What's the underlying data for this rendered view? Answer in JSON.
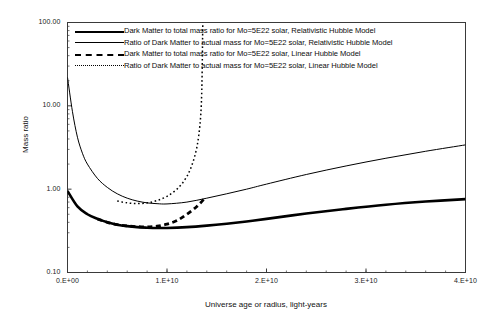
{
  "chart_data": {
    "type": "line",
    "title": "",
    "xlabel": "Universe age or radius, light-years",
    "ylabel": "Mass ratio",
    "yscale": "log",
    "xscale": "linear",
    "xlim": [
      0,
      40000000000
    ],
    "ylim": [
      0.1,
      100
    ],
    "grid": false,
    "legend_position": "top-inside",
    "xticks": [
      "0.E+00",
      "1.E+10",
      "2.E+10",
      "3.E+10",
      "4.E+10"
    ],
    "xtick_values": [
      0,
      10000000000,
      20000000000,
      30000000000,
      40000000000
    ],
    "yticks": [
      "100.00",
      "10.00",
      "1.00",
      "0.10"
    ],
    "ytick_values": [
      100,
      10,
      1,
      0.1
    ],
    "series": [
      {
        "name": "Dark Matter to total mass ratio for Mo=5E22 solar, Relativistic Hubble Model",
        "style": "thick-solid",
        "x": [
          0,
          1000000000,
          2000000000,
          3000000000,
          4000000000,
          5000000000,
          6000000000,
          7000000000,
          8000000000,
          9000000000,
          10000000000,
          12000000000,
          14000000000,
          16000000000,
          18000000000,
          20000000000,
          24000000000,
          28000000000,
          32000000000,
          36000000000,
          40000000000
        ],
        "y": [
          0.95,
          0.62,
          0.5,
          0.44,
          0.4,
          0.375,
          0.36,
          0.35,
          0.345,
          0.342,
          0.342,
          0.35,
          0.365,
          0.385,
          0.41,
          0.44,
          0.51,
          0.58,
          0.65,
          0.71,
          0.76
        ]
      },
      {
        "name": "Ratio of Dark Matter to actual mass for Mo=5E22 solar,  Relativistic Hubble Model",
        "style": "thin-solid",
        "x": [
          0,
          500000000,
          1000000000,
          1500000000,
          2000000000,
          3000000000,
          4000000000,
          5000000000,
          6000000000,
          7000000000,
          8000000000,
          9000000000,
          10000000000,
          12000000000,
          14000000000,
          16000000000,
          18000000000,
          20000000000,
          24000000000,
          28000000000,
          32000000000,
          36000000000,
          40000000000
        ],
        "y": [
          22.0,
          8.5,
          4.2,
          2.7,
          2.0,
          1.35,
          1.05,
          0.88,
          0.78,
          0.72,
          0.685,
          0.67,
          0.665,
          0.7,
          0.78,
          0.88,
          1.0,
          1.15,
          1.5,
          1.9,
          2.35,
          2.85,
          3.4
        ]
      },
      {
        "name": "Dark Matter to total mass ratio for Mo=5E22 solar, Linear Hubble Model",
        "style": "thick-dash",
        "x": [
          3000000000,
          4000000000,
          5000000000,
          6000000000,
          7000000000,
          8000000000,
          9000000000,
          10000000000,
          11000000000,
          12000000000,
          13000000000,
          13800000000
        ],
        "y": [
          0.44,
          0.4,
          0.375,
          0.362,
          0.355,
          0.352,
          0.36,
          0.38,
          0.42,
          0.5,
          0.62,
          0.78
        ]
      },
      {
        "name": "Ratio of Dark Matter to actual mass for Mo=5E22 solar, Linear Hubble Model",
        "style": "fine-dot",
        "x": [
          5000000000,
          6000000000,
          7000000000,
          8000000000,
          9000000000,
          10000000000,
          11000000000,
          11800000000,
          12400000000,
          12900000000,
          13200000000,
          13400000000,
          13500000000,
          13550000000,
          13580000000,
          13600000000
        ],
        "y": [
          0.72,
          0.685,
          0.672,
          0.685,
          0.73,
          0.82,
          1.0,
          1.3,
          1.8,
          2.8,
          4.5,
          8.0,
          16.0,
          35.0,
          70.0,
          100.0
        ]
      }
    ]
  },
  "legend": {
    "items": [
      {
        "sample": "thick-solid",
        "label": "Dark Matter to total mass ratio for Mo=5E22 solar, Relativistic Hubble Model"
      },
      {
        "sample": "thin-solid",
        "label": "Ratio of Dark Matter to actual mass for Mo=5E22 solar,  Relativistic Hubble Model"
      },
      {
        "sample": "thick-dash",
        "label": "Dark Matter to total mass ratio for Mo=5E22 solar, Linear Hubble Model"
      },
      {
        "sample": "fine-dot",
        "label": "Ratio of Dark Matter to actual mass for Mo=5E22 solar, Linear Hubble Model"
      }
    ]
  },
  "axes": {
    "x_title": "Universe age or radius, light-years",
    "y_title": "Mass ratio",
    "x_tick_labels": [
      "0.E+00",
      "1.E+10",
      "2.E+10",
      "3.E+10",
      "4.E+10"
    ],
    "y_tick_labels": [
      "100.00",
      "10.00",
      "1.00",
      "0.10"
    ]
  },
  "colors": {
    "line": "#000000",
    "axis": "#3a3a3a",
    "background": "#ffffff"
  }
}
